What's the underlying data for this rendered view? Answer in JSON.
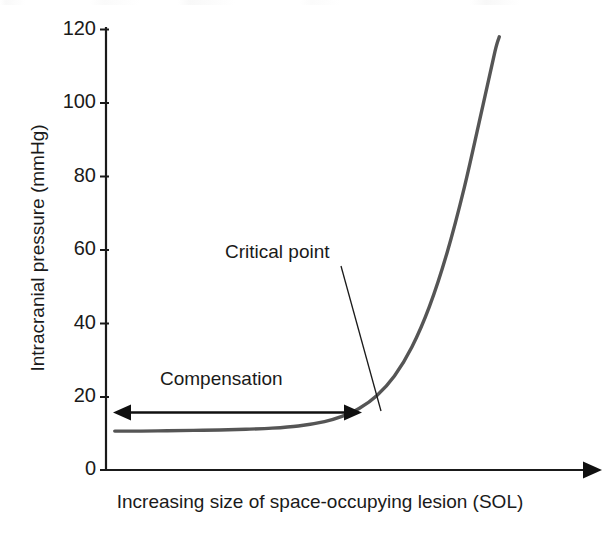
{
  "chart_data": {
    "type": "line",
    "title": "",
    "xlabel": "Increasing size of space-occupying lesion (SOL)",
    "ylabel": "Intracranial pressure (mmHg)",
    "ylim": [
      0,
      120
    ],
    "yticks": [
      0,
      20,
      40,
      60,
      80,
      100,
      120
    ],
    "ytick_labels": [
      "0",
      "20",
      "40",
      "60",
      "80",
      "100",
      "120"
    ],
    "xlim": [
      0,
      100
    ],
    "xticks": [],
    "xtick_labels": [],
    "grid": false,
    "legend": null,
    "series": [
      {
        "name": "Intracranial pressure response",
        "color": "#555555",
        "x": [
          2,
          8,
          14,
          20,
          26,
          32,
          38,
          44,
          50,
          54,
          58,
          62,
          66,
          70,
          74,
          78,
          82,
          86,
          89,
          90
        ],
        "values": [
          10.6,
          10.6,
          10.7,
          10.8,
          10.9,
          11.1,
          11.4,
          12.0,
          13.2,
          14.6,
          16.8,
          20.3,
          25.6,
          33.5,
          44.5,
          59.0,
          77.0,
          98.0,
          114.0,
          118.0
        ]
      }
    ],
    "annotations": [
      {
        "name": "critical-point",
        "label": "Critical point",
        "label_x": 37,
        "label_y": 60,
        "point_x": 58,
        "point_y": 16
      },
      {
        "name": "compensation-span",
        "label": "Compensation",
        "start_x": 2,
        "end_x": 52,
        "y": 16,
        "arrow_style": "double-headed"
      }
    ],
    "axis_arrow": {
      "axis": "x",
      "direction": "right",
      "present": true
    }
  },
  "colors": {
    "curve": "#555555",
    "axis": "#1a1a1a",
    "text": "#1a1a1a",
    "annotation": "#101010",
    "background": "#ffffff"
  }
}
